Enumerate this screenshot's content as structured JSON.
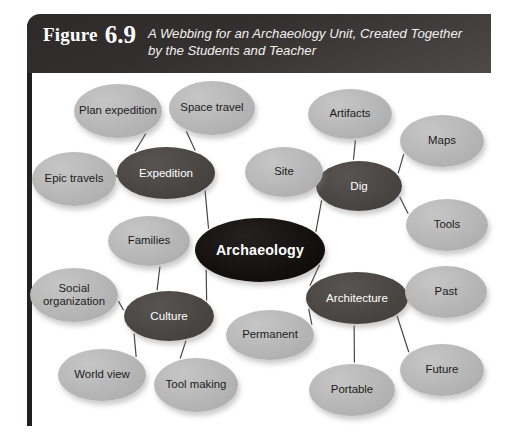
{
  "figure": {
    "label": "Figure",
    "number": "6.9",
    "title": "A Webbing for an Archaeology Unit, Created Together by the Students and Teacher"
  },
  "diagram": {
    "type": "concept-web",
    "center": {
      "id": "archaeology",
      "label": "Archaeology",
      "role": "center",
      "cx": 228,
      "cy": 177,
      "rx": 65,
      "ry": 32
    },
    "branches": [
      {
        "id": "expedition",
        "label": "Expedition",
        "role": "branch",
        "cx": 134,
        "cy": 100,
        "rx": 49,
        "ry": 26
      },
      {
        "id": "dig",
        "label": "Dig",
        "role": "branch",
        "cx": 327,
        "cy": 113,
        "rx": 43,
        "ry": 25
      },
      {
        "id": "culture",
        "label": "Culture",
        "role": "branch",
        "cx": 137,
        "cy": 243,
        "rx": 45,
        "ry": 25
      },
      {
        "id": "architecture",
        "label": "Architecture",
        "role": "branch",
        "cx": 325,
        "cy": 225,
        "rx": 51,
        "ry": 26
      }
    ],
    "leaves": [
      {
        "id": "plan-expedition",
        "label": "Plan expedition",
        "role": "leaf",
        "parent": "expedition",
        "cx": 86,
        "cy": 38,
        "rx": 44,
        "ry": 27
      },
      {
        "id": "space-travel",
        "label": "Space travel",
        "role": "leaf",
        "parent": "expedition",
        "cx": 180,
        "cy": 35,
        "rx": 43,
        "ry": 27
      },
      {
        "id": "epic-travels",
        "label": "Epic travels",
        "role": "leaf",
        "parent": "expedition",
        "cx": 42,
        "cy": 106,
        "rx": 42,
        "ry": 27
      },
      {
        "id": "site",
        "label": "Site",
        "role": "leaf",
        "parent": "dig",
        "cx": 252,
        "cy": 99,
        "rx": 39,
        "ry": 25
      },
      {
        "id": "artifacts",
        "label": "Artifacts",
        "role": "leaf",
        "parent": "dig",
        "cx": 318,
        "cy": 41,
        "rx": 42,
        "ry": 25
      },
      {
        "id": "maps",
        "label": "Maps",
        "role": "leaf",
        "parent": "dig",
        "cx": 410,
        "cy": 68,
        "rx": 42,
        "ry": 26
      },
      {
        "id": "tools",
        "label": "Tools",
        "role": "leaf",
        "parent": "dig",
        "cx": 415,
        "cy": 152,
        "rx": 41,
        "ry": 26
      },
      {
        "id": "families",
        "label": "Families",
        "role": "leaf",
        "parent": "culture",
        "cx": 117,
        "cy": 168,
        "rx": 41,
        "ry": 25
      },
      {
        "id": "social-organization",
        "label": "Social organization",
        "role": "leaf",
        "parent": "culture",
        "cx": 42,
        "cy": 222,
        "rx": 44,
        "ry": 27
      },
      {
        "id": "world-view",
        "label": "World view",
        "role": "leaf",
        "parent": "culture",
        "cx": 70,
        "cy": 302,
        "rx": 44,
        "ry": 26
      },
      {
        "id": "tool-making",
        "label": "Tool making",
        "role": "leaf",
        "parent": "culture",
        "cx": 164,
        "cy": 312,
        "rx": 42,
        "ry": 27
      },
      {
        "id": "permanent",
        "label": "Permanent",
        "role": "leaf",
        "parent": "architecture",
        "cx": 238,
        "cy": 262,
        "rx": 44,
        "ry": 25
      },
      {
        "id": "past",
        "label": "Past",
        "role": "leaf",
        "parent": "architecture",
        "cx": 414,
        "cy": 219,
        "rx": 41,
        "ry": 26
      },
      {
        "id": "future",
        "label": "Future",
        "role": "leaf",
        "parent": "architecture",
        "cx": 410,
        "cy": 297,
        "rx": 42,
        "ry": 26
      },
      {
        "id": "portable",
        "label": "Portable",
        "role": "leaf",
        "parent": "architecture",
        "cx": 320,
        "cy": 317,
        "rx": 43,
        "ry": 26
      }
    ],
    "edges": [
      {
        "from": "archaeology",
        "to": "expedition"
      },
      {
        "from": "archaeology",
        "to": "dig"
      },
      {
        "from": "archaeology",
        "to": "culture"
      },
      {
        "from": "archaeology",
        "to": "architecture"
      },
      {
        "from": "expedition",
        "to": "plan-expedition"
      },
      {
        "from": "expedition",
        "to": "space-travel"
      },
      {
        "from": "expedition",
        "to": "epic-travels"
      },
      {
        "from": "dig",
        "to": "site"
      },
      {
        "from": "dig",
        "to": "artifacts"
      },
      {
        "from": "dig",
        "to": "maps"
      },
      {
        "from": "dig",
        "to": "tools"
      },
      {
        "from": "culture",
        "to": "families"
      },
      {
        "from": "culture",
        "to": "social-organization"
      },
      {
        "from": "culture",
        "to": "world-view"
      },
      {
        "from": "culture",
        "to": "tool-making"
      },
      {
        "from": "architecture",
        "to": "permanent"
      },
      {
        "from": "architecture",
        "to": "past"
      },
      {
        "from": "architecture",
        "to": "future"
      },
      {
        "from": "architecture",
        "to": "portable"
      }
    ],
    "colors": {
      "center_fill": "#14100f",
      "branch_fill": "#4a4644",
      "leaf_fill": "#b6b6b6",
      "edge_stroke": "#4a4644",
      "header_bg": "#332f2e",
      "frame_bar": "#231f1e",
      "page_bg": "#ffffff"
    }
  }
}
